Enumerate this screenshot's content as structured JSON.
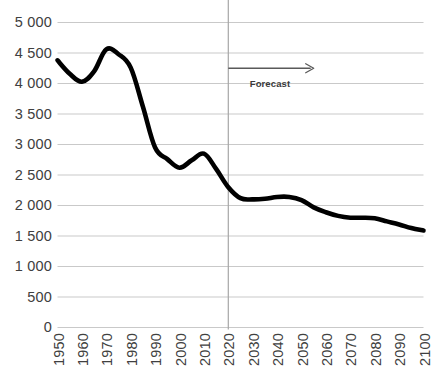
{
  "chart_data": {
    "type": "line",
    "title": "",
    "xlabel": "",
    "ylabel": "",
    "xlim": [
      1950,
      2100
    ],
    "ylim": [
      0,
      5000
    ],
    "grid": true,
    "legend": "none",
    "y_ticks": [
      0,
      500,
      1000,
      1500,
      2000,
      2500,
      3000,
      3500,
      4000,
      4500,
      5000
    ],
    "y_tick_labels": [
      "0",
      "500",
      "1 000",
      "1 500",
      "2 000",
      "2 500",
      "3 000",
      "3 500",
      "4 000",
      "4 500",
      "5 000"
    ],
    "x_ticks": [
      1950,
      1960,
      1970,
      1980,
      1990,
      2000,
      2010,
      2020,
      2030,
      2040,
      2050,
      2060,
      2070,
      2080,
      2090,
      2100
    ],
    "x_tick_labels": [
      "1950",
      "1960",
      "1970",
      "1980",
      "1990",
      "2000",
      "2010",
      "2020",
      "2030",
      "2040",
      "2050",
      "2060",
      "2070",
      "2080",
      "2090",
      "2100"
    ],
    "x": [
      1950,
      1955,
      1960,
      1965,
      1970,
      1975,
      1980,
      1985,
      1990,
      1995,
      2000,
      2005,
      2010,
      2015,
      2020,
      2025,
      2030,
      2035,
      2040,
      2045,
      2050,
      2055,
      2060,
      2065,
      2070,
      2075,
      2080,
      2085,
      2090,
      2095,
      2100
    ],
    "values": [
      4380,
      4160,
      4030,
      4200,
      4560,
      4480,
      4260,
      3620,
      2950,
      2760,
      2620,
      2740,
      2850,
      2600,
      2300,
      2120,
      2100,
      2110,
      2140,
      2140,
      2090,
      1970,
      1890,
      1830,
      1800,
      1800,
      1790,
      1740,
      1690,
      1630,
      1590
    ],
    "series": [
      {
        "name": "value",
        "color": "#000000",
        "values": [
          4380,
          4160,
          4030,
          4200,
          4560,
          4480,
          4260,
          3620,
          2950,
          2760,
          2620,
          2740,
          2850,
          2600,
          2300,
          2120,
          2100,
          2110,
          2140,
          2140,
          2090,
          1970,
          1890,
          1830,
          1800,
          1800,
          1790,
          1740,
          1690,
          1630,
          1590
        ]
      }
    ],
    "annotations": [
      {
        "name": "forecast-divider",
        "type": "vline",
        "x": 2020,
        "color": "#a6a6a6"
      },
      {
        "name": "forecast-arrow",
        "type": "arrow",
        "x_start": 2020,
        "x_end": 2055,
        "y": 4250,
        "color": "#595959"
      },
      {
        "name": "forecast-label",
        "type": "text",
        "text": "Forecast",
        "x": 2037,
        "y": 4000
      }
    ],
    "colors": {
      "line": "#000000",
      "gridline": "#c9c9c9",
      "axis_text": "#404040",
      "divider": "#a6a6a6",
      "annotation": "#595959",
      "background": "#ffffff"
    }
  }
}
